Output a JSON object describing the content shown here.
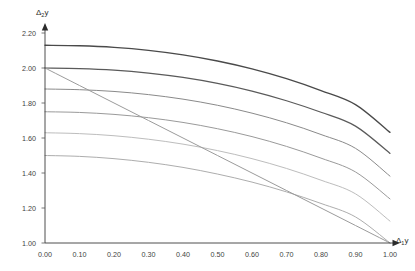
{
  "chart_data": {
    "type": "line",
    "title": "",
    "xlabel": "Δ₁y",
    "ylabel": "Δ₂y",
    "xlim": [
      0.0,
      1.0
    ],
    "ylim": [
      1.0,
      2.2
    ],
    "grid": false,
    "legend": "none",
    "xticks": [
      "0.00",
      "0.10",
      "0.20",
      "0.30",
      "0.40",
      "0.50",
      "0.60",
      "0.70",
      "0.80",
      "0.90",
      "1.00"
    ],
    "xtick_values": [
      0.0,
      0.1,
      0.2,
      0.3,
      0.4,
      0.5,
      0.6,
      0.7,
      0.8,
      0.9,
      1.0
    ],
    "yticks": [
      "1.00",
      "1.20",
      "1.40",
      "1.60",
      "1.80",
      "2.00",
      "2.20"
    ],
    "ytick_values": [
      1.0,
      1.2,
      1.4,
      1.6,
      1.8,
      2.0,
      2.2
    ],
    "x": [
      0.0,
      0.1,
      0.2,
      0.3,
      0.4,
      0.5,
      0.6,
      0.7,
      0.8,
      0.9,
      1.0
    ],
    "series": [
      {
        "name": "curve-1",
        "color": "#4a4a4a",
        "width": 1.35,
        "values": [
          2.13,
          2.127,
          2.118,
          2.101,
          2.075,
          2.04,
          1.995,
          1.939,
          1.871,
          1.791,
          1.632
        ]
      },
      {
        "name": "curve-2",
        "color": "#5a5a5a",
        "width": 1.25,
        "values": [
          2.0,
          1.997,
          1.988,
          1.971,
          1.946,
          1.912,
          1.868,
          1.813,
          1.747,
          1.668,
          1.512
        ]
      },
      {
        "name": "curve-3",
        "color": "#8a8a8a",
        "width": 1.0,
        "values": [
          1.88,
          1.876,
          1.866,
          1.848,
          1.822,
          1.787,
          1.742,
          1.687,
          1.62,
          1.541,
          1.382
        ]
      },
      {
        "name": "curve-4",
        "color": "#9a9a9a",
        "width": 1.0,
        "values": [
          1.75,
          1.746,
          1.735,
          1.716,
          1.689,
          1.653,
          1.608,
          1.552,
          1.485,
          1.406,
          1.252
        ]
      },
      {
        "name": "curve-5",
        "color": "#bdbdbd",
        "width": 1.0,
        "values": [
          1.63,
          1.625,
          1.613,
          1.593,
          1.565,
          1.528,
          1.482,
          1.426,
          1.359,
          1.281,
          1.125
        ]
      },
      {
        "name": "curve-6",
        "color": "#adadad",
        "width": 1.0,
        "values": [
          1.5,
          1.495,
          1.482,
          1.461,
          1.432,
          1.394,
          1.348,
          1.292,
          1.226,
          1.149,
          1.0
        ]
      },
      {
        "name": "straight-line",
        "color": "#9b9b9b",
        "width": 1.0,
        "values": [
          2.0,
          1.9,
          1.8,
          1.7,
          1.6,
          1.5,
          1.4,
          1.3,
          1.2,
          1.1,
          1.0
        ]
      }
    ]
  },
  "axes": {
    "y_title_main": "Δ",
    "y_title_sub": "2",
    "y_title_tail": "y",
    "x_title_main": "Δ",
    "x_title_sub": "1",
    "x_title_tail": "y"
  }
}
